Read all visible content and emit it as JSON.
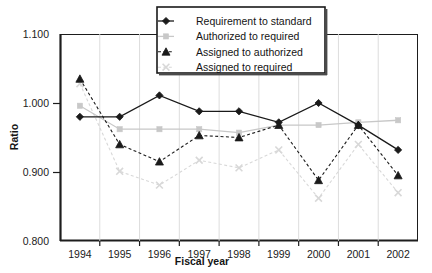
{
  "chart_data": {
    "type": "line",
    "title": "",
    "xlabel": "Fiscal year",
    "ylabel": "Ratio",
    "categories": [
      1994,
      1995,
      1996,
      1997,
      1998,
      1999,
      2000,
      2001,
      2002
    ],
    "x_tick_labels": [
      "1994",
      "1995",
      "1996",
      "1997",
      "1998",
      "1999",
      "2000",
      "2001",
      "2002"
    ],
    "y_tick_labels": [
      "1.100",
      "1.000",
      "0.900",
      "0.800"
    ],
    "y_ticks": [
      1.1,
      1.0,
      0.9,
      0.8
    ],
    "ylim": [
      0.8,
      1.1
    ],
    "grid": false,
    "legend_position": "top-center",
    "series": [
      {
        "name": "Requirement to standard",
        "marker": "diamond",
        "line_style": "solid",
        "color": "#1a1a1a",
        "values": [
          0.98,
          0.98,
          1.011,
          0.988,
          0.988,
          0.972,
          1.0,
          0.968,
          0.932
        ]
      },
      {
        "name": "Authorized to required",
        "marker": "square",
        "line_style": "solid",
        "color": "#c8c8c8",
        "values": [
          0.996,
          0.962,
          0.962,
          0.962,
          0.957,
          0.968,
          0.968,
          0.972,
          0.975
        ]
      },
      {
        "name": "Assigned to authorized",
        "marker": "triangle",
        "line_style": "dashed",
        "color": "#1a1a1a",
        "values": [
          1.035,
          0.94,
          0.915,
          0.953,
          0.95,
          0.968,
          0.888,
          0.968,
          0.895
        ]
      },
      {
        "name": "Assigned to required",
        "marker": "cross",
        "line_style": "dashed",
        "color": "#d8d8d8",
        "values": [
          1.028,
          0.901,
          0.881,
          0.917,
          0.906,
          0.932,
          0.862,
          0.94,
          0.87
        ]
      }
    ]
  },
  "legend": {
    "items": [
      {
        "label": "Requirement to standard"
      },
      {
        "label": "Authorized to required"
      },
      {
        "label": "Assigned to authorized"
      },
      {
        "label": "Assigned to required"
      }
    ]
  },
  "colors": {
    "axis": "#1d1d1d",
    "dark_series": "#1a1a1a",
    "light_series": "#c8c8c8",
    "lighter_series": "#d8d8d8",
    "background": "#ffffff"
  }
}
